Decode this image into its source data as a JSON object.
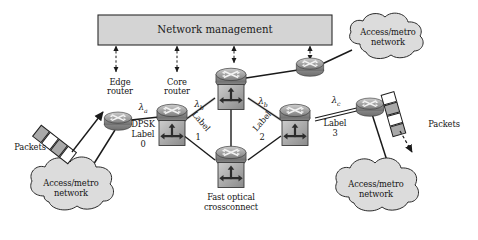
{
  "figure": {
    "type": "network-diagram",
    "title_box": "Network management",
    "background": "#ffffff",
    "box_fill": "#d4d4d4",
    "cloud_fill": "#dcdcdc",
    "node_fill": "#9c9c9c",
    "line_color": "#1a1a1a"
  },
  "management": {
    "label": "Network management",
    "arrow_count": 4
  },
  "nodes": {
    "edge_router": {
      "label": "Edge\nrouter"
    },
    "core_router": {
      "label": "Core\nrouter"
    },
    "fast_optical_crossconnect": {
      "label": "Fast optical\ncrossconnect"
    }
  },
  "clouds": [
    {
      "label": "Access/metro\nnetwork",
      "position": "top-right"
    },
    {
      "label": "Access/metro\nnetwork",
      "position": "bottom-left"
    },
    {
      "label": "Access/metro\nnetwork",
      "position": "bottom-right"
    }
  ],
  "packets": [
    {
      "label": "Packets",
      "position": "left",
      "direction": "into-network"
    },
    {
      "label": "Packets",
      "position": "right",
      "direction": "out-of-network"
    }
  ],
  "links": [
    {
      "lambda": "λ",
      "lambda_sub": "a",
      "label": "DPSK\nLabel\n0",
      "modulation": "DPSK",
      "label_index": "0"
    },
    {
      "lambda": "λ",
      "lambda_sub": "b",
      "label": "Label\n1",
      "label_index": "1"
    },
    {
      "lambda": "λ",
      "lambda_sub": "b",
      "label": "Label\n2",
      "label_index": "2"
    },
    {
      "lambda": "λ",
      "lambda_sub": "c",
      "label": "Label\n3",
      "label_index": "3"
    }
  ],
  "text": {
    "edge_router_l1": "Edge",
    "edge_router_l2": "router",
    "core_router_l1": "Core",
    "core_router_l2": "router",
    "fox_l1": "Fast optical",
    "fox_l2": "crossconnect",
    "cloud_l1": "Access/metro",
    "cloud_l2": "network",
    "packets": "Packets",
    "dpsk": "DPSK",
    "label_word": "Label",
    "lambda_a_sub": "a",
    "lambda_b_sub": "b",
    "lambda_c_sub": "c",
    "idx0": "0",
    "idx1": "1",
    "idx2": "2",
    "idx3": "3"
  }
}
